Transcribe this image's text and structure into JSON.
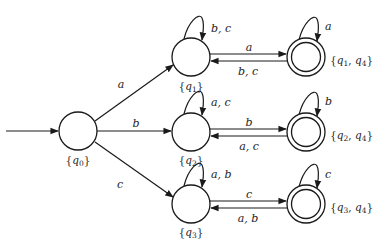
{
  "diagram": {
    "type": "DFA state diagram (subset construction)",
    "stroke_color": "#1a1a1a",
    "background": "#ffffff",
    "start_state": "q0",
    "states": [
      {
        "id": "s0",
        "label_base": "q",
        "label_subs": [
          "0"
        ],
        "accepting": false,
        "x": 78,
        "y": 131
      },
      {
        "id": "s1",
        "label_base": "q",
        "label_subs": [
          "1"
        ],
        "accepting": false,
        "x": 191,
        "y": 57
      },
      {
        "id": "s2",
        "label_base": "q",
        "label_subs": [
          "2"
        ],
        "accepting": false,
        "x": 191,
        "y": 132
      },
      {
        "id": "s3",
        "label_base": "q",
        "label_subs": [
          "3"
        ],
        "accepting": false,
        "x": 191,
        "y": 204
      },
      {
        "id": "s14",
        "label_base": "q",
        "label_subs": [
          "1",
          "4"
        ],
        "accepting": true,
        "x": 306,
        "y": 57
      },
      {
        "id": "s24",
        "label_base": "q",
        "label_subs": [
          "2",
          "4"
        ],
        "accepting": true,
        "x": 306,
        "y": 132
      },
      {
        "id": "s34",
        "label_base": "q",
        "label_subs": [
          "3",
          "4"
        ],
        "accepting": true,
        "x": 306,
        "y": 204
      }
    ],
    "transitions": [
      {
        "from": "s0",
        "to": "s1",
        "label": "a"
      },
      {
        "from": "s0",
        "to": "s2",
        "label": "b"
      },
      {
        "from": "s0",
        "to": "s3",
        "label": "c"
      },
      {
        "from": "s1",
        "to": "s1",
        "label": "b, c"
      },
      {
        "from": "s1",
        "to": "s14",
        "label": "a"
      },
      {
        "from": "s14",
        "to": "s1",
        "label": "b, c"
      },
      {
        "from": "s14",
        "to": "s14",
        "label": "a"
      },
      {
        "from": "s2",
        "to": "s2",
        "label": "a, c"
      },
      {
        "from": "s2",
        "to": "s24",
        "label": "b"
      },
      {
        "from": "s24",
        "to": "s2",
        "label": "a, c"
      },
      {
        "from": "s24",
        "to": "s24",
        "label": "b"
      },
      {
        "from": "s3",
        "to": "s3",
        "label": "a, b"
      },
      {
        "from": "s3",
        "to": "s34",
        "label": "c"
      },
      {
        "from": "s34",
        "to": "s3",
        "label": "a, b"
      },
      {
        "from": "s34",
        "to": "s34",
        "label": "c"
      }
    ],
    "labels": {
      "e_q0_q1": "a",
      "e_q0_q2": "b",
      "e_q0_q3": "c",
      "loop_q1": "b, c",
      "fwd_q1": "a",
      "back_q1": "b, c",
      "loop_q14": "a",
      "loop_q2": "a, c",
      "fwd_q2": "b",
      "back_q2": "a, c",
      "loop_q24": "b",
      "loop_q3": "a, b",
      "fwd_q3": "c",
      "back_q3": "a, b",
      "loop_q34": "c",
      "set_q0": {
        "open": "{",
        "q": "q",
        "s1": "0",
        "close": "}"
      },
      "set_q1": {
        "open": "{",
        "q": "q",
        "s1": "1",
        "close": "}"
      },
      "set_q2": {
        "open": "{",
        "q": "q",
        "s1": "2",
        "close": "}"
      },
      "set_q3": {
        "open": "{",
        "q": "q",
        "s1": "3",
        "close": "}"
      },
      "set_q14": {
        "open": "{",
        "q": "q",
        "s1": "1",
        "sep": ", ",
        "q2": "q",
        "s2": "4",
        "close": "}"
      },
      "set_q24": {
        "open": "{",
        "q": "q",
        "s1": "2",
        "sep": ", ",
        "q2": "q",
        "s2": "4",
        "close": "}"
      },
      "set_q34": {
        "open": "{",
        "q": "q",
        "s1": "3",
        "sep": ", ",
        "q2": "q",
        "s2": "4",
        "close": "}"
      }
    }
  }
}
